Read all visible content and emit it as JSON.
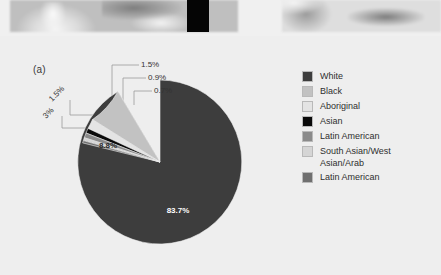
{
  "figure": {
    "panel_label": "(a)",
    "background_color": "#eeeeee"
  },
  "photo_strip": {
    "left_photo_name": "blurred-grayscale-photo-left",
    "black_block_name": "black-rectangle-block",
    "right_photo_name": "blurred-grayscale-photo-right"
  },
  "legend": {
    "items": [
      {
        "label": "White",
        "color": "#3d3d3d"
      },
      {
        "label": "Black",
        "color": "#c2c2c2"
      },
      {
        "label": "Aboriginal",
        "color": "#e4e4e4"
      },
      {
        "label": "Asian",
        "color": "#0a0a0a"
      },
      {
        "label": "Latin American",
        "color": "#8a8a8a"
      },
      {
        "label": "South Asian/West\nAsian/Arab",
        "color": "#d5d5d5"
      },
      {
        "label": "Latin American",
        "color": "#6f6f6f"
      }
    ]
  },
  "chart_data": {
    "type": "pie",
    "title": "",
    "legend_position": "right",
    "categories": [
      "White",
      "Black",
      "Aboriginal",
      "Asian",
      "Latin American",
      "South Asian/West Asian/Arab",
      "Latin American"
    ],
    "values": [
      83.7,
      8.8,
      3.0,
      1.5,
      1.5,
      0.9,
      0.7
    ],
    "value_labels": [
      "83.7%",
      "8.8%",
      "3%",
      "1.5%",
      "1.5%",
      "0.9%",
      "0.7%"
    ],
    "colors": [
      "#3d3d3d",
      "#c2c2c2",
      "#e4e4e4",
      "#0a0a0a",
      "#8a8a8a",
      "#d5d5d5",
      "#6f6f6f"
    ],
    "inside_labels": [
      "83.7%",
      "8.8%"
    ],
    "callout_labels": [
      "3%",
      "1.5%",
      "1.5%",
      "0.9%",
      "0.7%"
    ],
    "units": "percent",
    "total": 100.1
  },
  "pie_label_text": {
    "big": "83.7%",
    "second": "8.8%",
    "c_three": "3%",
    "c_onefive_lower": "1.5%",
    "c_onefive_upper": "1.5%",
    "c_ninetenths": "0.9%",
    "c_seventenths": "0.7%"
  }
}
